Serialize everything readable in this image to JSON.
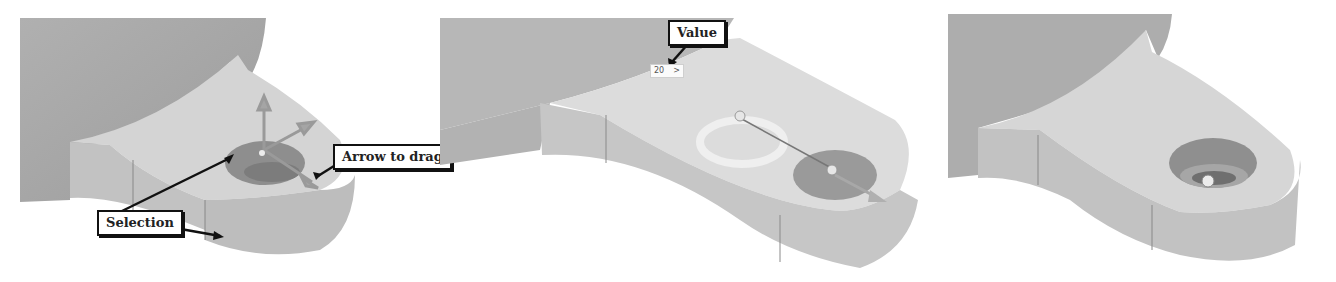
{
  "figure": {
    "panels": [
      {
        "id": "panel-1",
        "description": "Bracket with hole selected and drag manipulator arrows",
        "callouts": [
          {
            "label": "Selection"
          },
          {
            "label": "Arrow to drag"
          }
        ]
      },
      {
        "id": "panel-2",
        "description": "Hole being dragged along the bracket with value input",
        "callouts": [
          {
            "label": "Value"
          }
        ],
        "value_input": {
          "value": "20",
          "suffix": ">"
        }
      },
      {
        "id": "panel-3",
        "description": "Bracket with counterbored hole at new position",
        "callouts": []
      }
    ],
    "colors": {
      "background": "#ffffff",
      "body_dark": "#a9a9a9",
      "body_mid": "#c4c4c4",
      "body_light": "#d8d8d8",
      "selection": "#8e8e8e",
      "callout_border": "#111111"
    }
  }
}
